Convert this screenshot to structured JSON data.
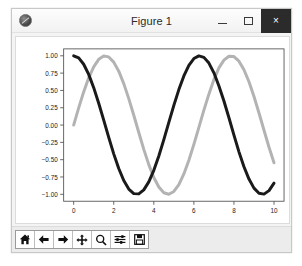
{
  "window": {
    "title": "Figure 1",
    "icon": "matplotlib-icon",
    "controls": {
      "minimize_label": "–",
      "maximize_label": "□",
      "close_label": "×"
    }
  },
  "toolbar": {
    "buttons": [
      {
        "name": "home-icon",
        "tooltip": "Home"
      },
      {
        "name": "back-arrow-icon",
        "tooltip": "Back"
      },
      {
        "name": "forward-arrow-icon",
        "tooltip": "Forward"
      },
      {
        "name": "pan-move-icon",
        "tooltip": "Pan"
      },
      {
        "name": "zoom-magnifier-icon",
        "tooltip": "Zoom to rectangle"
      },
      {
        "name": "configure-subplots-icon",
        "tooltip": "Configure subplots"
      },
      {
        "name": "save-disk-icon",
        "tooltip": "Save the figure"
      }
    ]
  },
  "chart_data": {
    "type": "line",
    "title": "",
    "xlabel": "",
    "ylabel": "",
    "xlim": [
      -0.5,
      10.5
    ],
    "ylim": [
      -1.1,
      1.1
    ],
    "grid": false,
    "legend": null,
    "xticks": [
      0,
      2,
      4,
      6,
      8,
      10
    ],
    "xticklabels": [
      "0",
      "2",
      "4",
      "6",
      "8",
      "10"
    ],
    "yticks": [
      -1.0,
      -0.75,
      -0.5,
      -0.25,
      0.0,
      0.25,
      0.5,
      0.75,
      1.0
    ],
    "yticklabels": [
      "-1.00",
      "-0.75",
      "-0.50",
      "-0.25",
      "0.00",
      "0.25",
      "0.50",
      "0.75",
      "1.00"
    ],
    "series": [
      {
        "name": "cos(x)",
        "color": "#1a1a1a",
        "linewidth": 3.0,
        "x": [
          0,
          0.25,
          0.5,
          0.75,
          1,
          1.25,
          1.5,
          1.75,
          2,
          2.25,
          2.5,
          2.75,
          3,
          3.25,
          3.5,
          3.75,
          4,
          4.25,
          4.5,
          4.75,
          5,
          5.25,
          5.5,
          5.75,
          6,
          6.25,
          6.5,
          6.75,
          7,
          7.25,
          7.5,
          7.75,
          8,
          8.25,
          8.5,
          8.75,
          9,
          9.25,
          9.5,
          9.75,
          10
        ],
        "y": [
          1.0,
          0.969,
          0.878,
          0.732,
          0.54,
          0.315,
          0.071,
          -0.178,
          -0.416,
          -0.628,
          -0.801,
          -0.924,
          -0.99,
          -0.994,
          -0.936,
          -0.821,
          -0.654,
          -0.447,
          -0.211,
          0.038,
          0.284,
          0.512,
          0.709,
          0.862,
          0.96,
          0.999,
          0.977,
          0.895,
          0.754,
          0.565,
          0.347,
          0.105,
          -0.146,
          -0.387,
          -0.602,
          -0.78,
          -0.911,
          -0.985,
          -0.997,
          -0.947,
          -0.839
        ]
      },
      {
        "name": "sin(x)",
        "color": "#b3b3b3",
        "linewidth": 3.0,
        "x": [
          0,
          0.25,
          0.5,
          0.75,
          1,
          1.25,
          1.5,
          1.75,
          2,
          2.25,
          2.5,
          2.75,
          3,
          3.25,
          3.5,
          3.75,
          4,
          4.25,
          4.5,
          4.75,
          5,
          5.25,
          5.5,
          5.75,
          6,
          6.25,
          6.5,
          6.75,
          7,
          7.25,
          7.5,
          7.75,
          8,
          8.25,
          8.5,
          8.75,
          9,
          9.25,
          9.5,
          9.75,
          10
        ],
        "y": [
          0.0,
          0.247,
          0.479,
          0.682,
          0.841,
          0.949,
          0.997,
          0.984,
          0.909,
          0.778,
          0.598,
          0.382,
          0.141,
          -0.108,
          -0.351,
          -0.571,
          -0.757,
          -0.895,
          -0.978,
          -0.999,
          -0.959,
          -0.859,
          -0.706,
          -0.508,
          -0.279,
          -0.034,
          0.215,
          0.446,
          0.657,
          0.825,
          0.938,
          0.994,
          0.989,
          0.922,
          0.798,
          0.625,
          0.412,
          0.174,
          -0.075,
          -0.32,
          -0.544
        ]
      }
    ]
  }
}
